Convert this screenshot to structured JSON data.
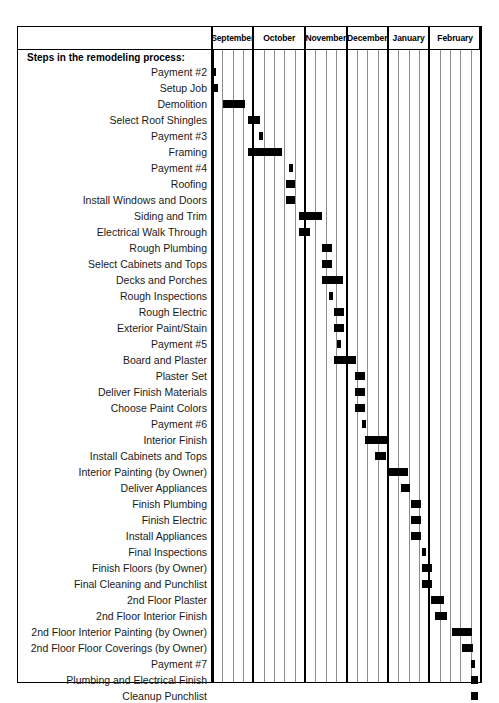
{
  "chart_data": {
    "type": "bar",
    "subtype": "gantt",
    "title": "Steps in the remodeling process:",
    "xlabel": "",
    "ylabel": "",
    "grid": true,
    "legend": "none",
    "timeline": {
      "unit": "week",
      "total_weeks": 26,
      "months": [
        {
          "label": "September",
          "weeks": 4
        },
        {
          "label": "October",
          "weeks": 5
        },
        {
          "label": "November",
          "weeks": 4
        },
        {
          "label": "December",
          "weeks": 4
        },
        {
          "label": "January",
          "weeks": 4
        },
        {
          "label": "February",
          "weeks": 5
        }
      ]
    },
    "categories": [
      "Payment #2",
      "Setup Job",
      "Demolition",
      "Select Roof Shingles",
      "Payment #3",
      "Framing",
      "Payment #4",
      "Roofing",
      "Install Windows and Doors",
      "Siding and Trim",
      "Electrical Walk Through",
      "Rough Plumbing",
      "Select Cabinets and Tops",
      "Decks and Porches",
      "Rough Inspections",
      "Rough Electric",
      "Exterior Paint/Stain",
      "Payment #5",
      "Board and Plaster",
      "Plaster Set",
      "Deliver Finish Materials",
      "Choose Paint Colors",
      "Payment #6",
      "Interior Finish",
      "Install Cabinets and Tops",
      "Interior Painting (by Owner)",
      "Deliver Appliances",
      "Finish Plumbing",
      "Finish Electric",
      "Install Appliances",
      "Final Inspections",
      "Finish Floors (by Owner)",
      "Final Cleaning and Punchlist",
      "2nd Floor Plaster",
      "2nd Floor Interior Finish",
      "2nd Floor Interior Painting (by Owner)",
      "2nd Floor Floor Coverings (by Owner)",
      "Payment #7",
      "Plumbing and Electrical Finish",
      "Cleanup Punchlist"
    ],
    "tasks": [
      {
        "name": "Payment #2",
        "start_week": 0.0,
        "duration_weeks": 0.35
      },
      {
        "name": "Setup Job",
        "start_week": 0.0,
        "duration_weeks": 0.55
      },
      {
        "name": "Demolition",
        "start_week": 1.1,
        "duration_weeks": 2.1
      },
      {
        "name": "Select Roof Shingles",
        "start_week": 3.5,
        "duration_weeks": 1.1
      },
      {
        "name": "Payment #3",
        "start_week": 4.5,
        "duration_weeks": 0.35
      },
      {
        "name": "Framing",
        "start_week": 3.5,
        "duration_weeks": 3.3
      },
      {
        "name": "Payment #4",
        "start_week": 7.4,
        "duration_weeks": 0.4
      },
      {
        "name": "Roofing",
        "start_week": 7.2,
        "duration_weeks": 0.85
      },
      {
        "name": "Install Windows and Doors",
        "start_week": 7.2,
        "duration_weeks": 0.85
      },
      {
        "name": "Siding and Trim",
        "start_week": 8.4,
        "duration_weeks": 2.2
      },
      {
        "name": "Electrical Walk Through",
        "start_week": 8.4,
        "duration_weeks": 1.1
      },
      {
        "name": "Rough Plumbing",
        "start_week": 10.6,
        "duration_weeks": 1.0
      },
      {
        "name": "Select Cabinets and Tops",
        "start_week": 10.6,
        "duration_weeks": 1.0
      },
      {
        "name": "Decks and Porches",
        "start_week": 10.6,
        "duration_weeks": 2.1
      },
      {
        "name": "Rough Inspections",
        "start_week": 11.3,
        "duration_weeks": 0.35
      },
      {
        "name": "Rough Electric",
        "start_week": 11.8,
        "duration_weeks": 1.0
      },
      {
        "name": "Exterior Paint/Stain",
        "start_week": 11.8,
        "duration_weeks": 1.0
      },
      {
        "name": "Payment #5",
        "start_week": 12.1,
        "duration_weeks": 0.35
      },
      {
        "name": "Board and Plaster",
        "start_week": 11.8,
        "duration_weeks": 2.1
      },
      {
        "name": "Plaster Set",
        "start_week": 13.8,
        "duration_weeks": 1.0
      },
      {
        "name": "Deliver Finish Materials",
        "start_week": 13.8,
        "duration_weeks": 1.0
      },
      {
        "name": "Choose Paint Colors",
        "start_week": 13.8,
        "duration_weeks": 1.0
      },
      {
        "name": "Payment #6",
        "start_week": 14.5,
        "duration_weeks": 0.35
      },
      {
        "name": "Interior Finish",
        "start_week": 14.8,
        "duration_weeks": 2.1
      },
      {
        "name": "Install Cabinets and Tops",
        "start_week": 15.8,
        "duration_weeks": 1.0
      },
      {
        "name": "Interior Painting (by Owner)",
        "start_week": 17.0,
        "duration_weeks": 1.9
      },
      {
        "name": "Deliver Appliances",
        "start_week": 18.3,
        "duration_weeks": 0.8
      },
      {
        "name": "Finish Plumbing",
        "start_week": 19.2,
        "duration_weeks": 1.0
      },
      {
        "name": "Finish Electric",
        "start_week": 19.2,
        "duration_weeks": 1.0
      },
      {
        "name": "Install Appliances",
        "start_week": 19.2,
        "duration_weeks": 1.0
      },
      {
        "name": "Final Inspections",
        "start_week": 20.3,
        "duration_weeks": 0.35
      },
      {
        "name": "Finish Floors (by Owner)",
        "start_week": 20.3,
        "duration_weeks": 1.0
      },
      {
        "name": "Final Cleaning and Punchlist",
        "start_week": 20.3,
        "duration_weeks": 1.0
      },
      {
        "name": "2nd Floor Plaster",
        "start_week": 21.2,
        "duration_weeks": 1.2
      },
      {
        "name": "2nd Floor Interior Finish",
        "start_week": 21.6,
        "duration_weeks": 1.1
      },
      {
        "name": "2nd Floor Interior Painting (by Owner)",
        "start_week": 23.2,
        "duration_weeks": 1.9
      },
      {
        "name": "2nd Floor Floor Coverings (by Owner)",
        "start_week": 24.2,
        "duration_weeks": 1.0
      },
      {
        "name": "Payment #7",
        "start_week": 25.0,
        "duration_weeks": 0.35
      },
      {
        "name": "Plumbing and Electrical Finish",
        "start_week": 25.0,
        "duration_weeks": 0.7
      },
      {
        "name": "Cleanup Punchlist",
        "start_week": 25.0,
        "duration_weeks": 0.7
      }
    ],
    "colors": {
      "bar": "#000000",
      "grid_week": "#8d8d8d",
      "grid_month": "#000000",
      "background": "#ffffff",
      "text": "#1a1a1a"
    }
  }
}
